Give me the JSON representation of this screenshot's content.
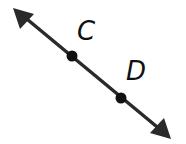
{
  "diagram": {
    "type": "line",
    "line": {
      "start": [
        13,
        8
      ],
      "end": [
        171,
        139
      ],
      "color": "#2a2a2a",
      "arrows": "both"
    },
    "points": [
      {
        "label": "C",
        "x": 72,
        "y": 56
      },
      {
        "label": "D",
        "x": 121,
        "y": 98
      }
    ],
    "labels": {
      "c": "C",
      "d": "D"
    }
  }
}
